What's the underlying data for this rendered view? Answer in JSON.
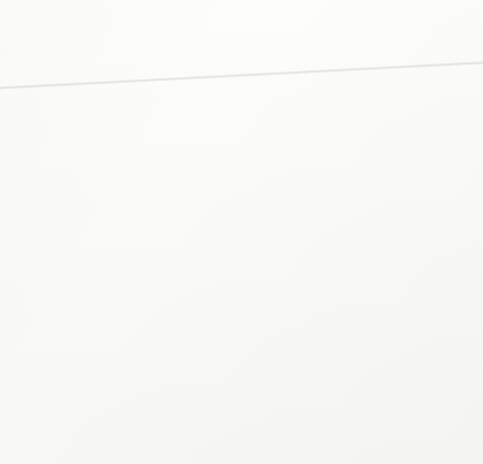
{
  "figure": {
    "kind": "anatomical-line-drawing-plate",
    "layout": {
      "rows": 2,
      "columns": 2,
      "panel_count": 4
    },
    "ink_color": "#1a1a1a",
    "background_color": "#fbfbf9",
    "frame_color": "#a9a9a7",
    "panels": [
      {
        "index": 1,
        "caption": "Nonpregnant",
        "position": "top-left",
        "described_structures": [
          "uterine horns, small and tightly coiled",
          "ovaries with visible follicles, both sides",
          "broad ligament with fine vascular striations",
          "cervix with prominent transverse ridges",
          "vagina / vestibule at base"
        ]
      },
      {
        "index": 2,
        "caption": "25 to 30 days pregnant",
        "position": "top-right",
        "described_structures": [
          "right uterine horn slightly enlarged",
          "ovaries with corpus luteum on gravid side",
          "broad ligament stretched",
          "cervix with transverse ridges",
          "oviducts at horn tips"
        ]
      },
      {
        "index": 3,
        "caption": "45 days pregnant",
        "position": "bottom-left",
        "described_structures": [
          "gravid horn markedly distended, pendulous",
          "ovaries displaced forward and downward",
          "uterine body enlarged and rounded",
          "cervix drawn toward gravid horn"
        ]
      },
      {
        "index": 4,
        "caption": "60 days pregnant",
        "position": "bottom-right",
        "described_structures": [
          "gravid horn greatly enlarged, filling lower field",
          "ovaries drawn far cranially with stretched ligament",
          "non-gravid horn tapered at right",
          "smooth distended uterine wall"
        ]
      }
    ]
  }
}
